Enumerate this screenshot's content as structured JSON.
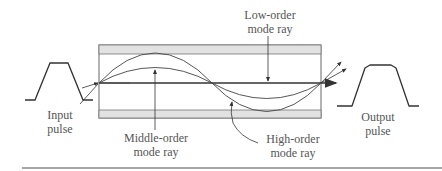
{
  "figure": {
    "type": "multimode-fiber-dispersion",
    "labels": {
      "input_pulse_1": "Input",
      "input_pulse_2": "pulse",
      "output_pulse_1": "Output",
      "output_pulse_2": "pulse",
      "middle_1": "Middle-order",
      "middle_2": "mode ray",
      "low_1": "Low-order",
      "low_2": "mode ray",
      "high_1": "High-order",
      "high_2": "mode ray"
    },
    "colors": {
      "line": "#333333",
      "cladding": "#e2e2e2",
      "text": "#555555"
    }
  }
}
